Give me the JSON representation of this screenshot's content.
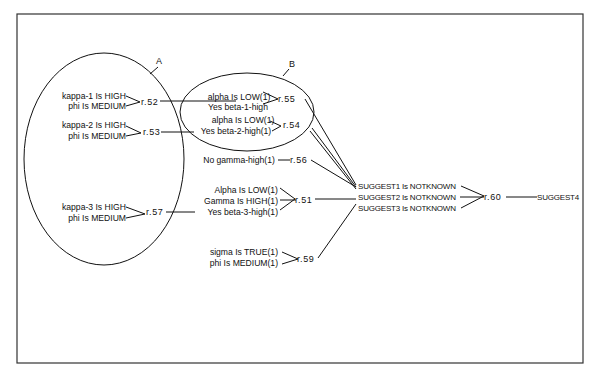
{
  "diagram": {
    "groups": [
      {
        "id": "A",
        "label": "A"
      },
      {
        "id": "B",
        "label": "B"
      }
    ],
    "rules": {
      "r52": {
        "label": "r.52",
        "inputs": [
          "kappa-1 Is HIGH",
          "phi Is MEDIUM"
        ]
      },
      "r53": {
        "label": "r.53",
        "inputs": [
          "kappa-2 Is HIGH",
          "phi Is MEDIUM"
        ]
      },
      "r57": {
        "label": "r.57",
        "inputs": [
          "kappa-3 Is HIGH",
          "phi Is MEDIUM"
        ]
      },
      "r55": {
        "label": "r.55",
        "inputs": [
          "alpha Is LOW(1)",
          "Yes beta-1-high"
        ]
      },
      "r54": {
        "label": "r.54",
        "inputs": [
          "alpha Is LOW(1)",
          "Yes  beta-2-high(1)"
        ]
      },
      "r56": {
        "label": "r.56",
        "inputs": [
          "No  gamma-high(1)"
        ]
      },
      "r51": {
        "label": "r.51",
        "inputs": [
          "Alpha Is LOW(1)",
          "Gamma Is HIGH(1)",
          "Yes  beta-3-high(1)"
        ]
      },
      "r59": {
        "label": "r.59",
        "inputs": [
          "sigma Is TRUE(1)",
          "phi Is MEDIUM(1)"
        ]
      },
      "r60": {
        "label": "r.60",
        "inputs": [
          "SUGGEST1 Is NOTKNOWN",
          "SUGGEST2 Is NOTKNOWN",
          "SUGGEST3 Is NOTKNOWN"
        ]
      }
    },
    "output": "SUGGEST4"
  }
}
